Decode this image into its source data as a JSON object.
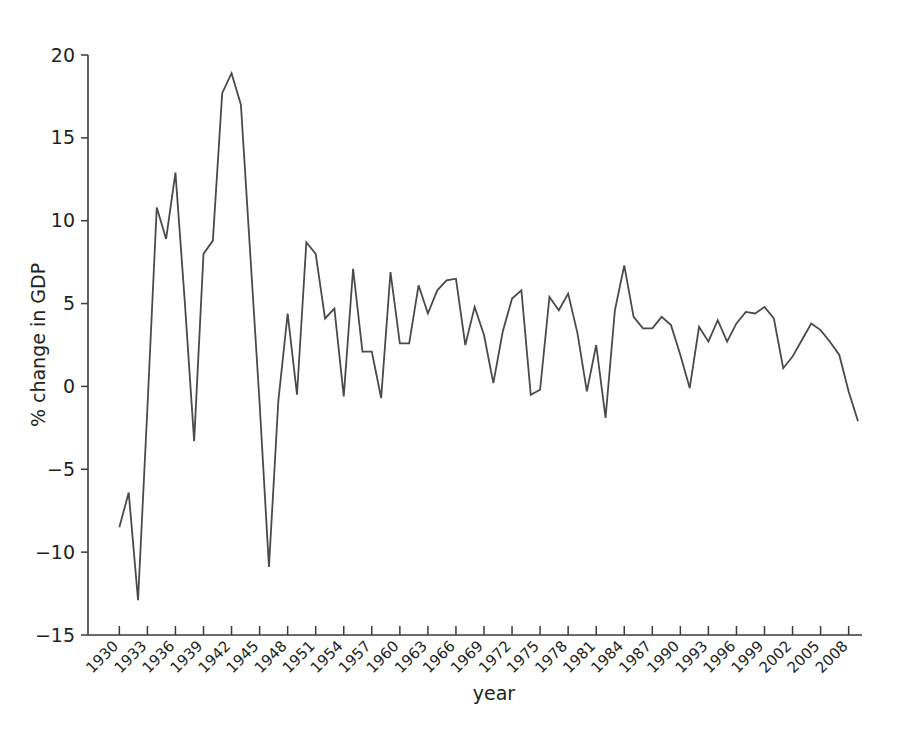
{
  "chart_data": {
    "type": "line",
    "title": "",
    "xlabel": "year",
    "ylabel": "% change in GDP",
    "xlim": [
      1929,
      2009
    ],
    "ylim": [
      -15,
      20
    ],
    "yticks": [
      20,
      15,
      10,
      5,
      0,
      -5,
      -10,
      -15
    ],
    "ytick_labels": [
      "20",
      "15",
      "10",
      "5",
      "0",
      "−5",
      "−10",
      "−15"
    ],
    "xticks": [
      1930,
      1933,
      1936,
      1939,
      1942,
      1945,
      1948,
      1951,
      1954,
      1957,
      1960,
      1963,
      1966,
      1969,
      1972,
      1975,
      1978,
      1981,
      1984,
      1987,
      1990,
      1993,
      1996,
      1999,
      2002,
      2005,
      2008
    ],
    "xtick_labels": [
      "1930",
      "1933",
      "1936",
      "1939",
      "1942",
      "1945",
      "1948",
      "1951",
      "1954",
      "1957",
      "1960",
      "1963",
      "1966",
      "1969",
      "1972",
      "1975",
      "1978",
      "1981",
      "1984",
      "1987",
      "1990",
      "1993",
      "1996",
      "1999",
      "2002",
      "2005",
      "2008"
    ],
    "xtick_minor_step": 1,
    "grid": false,
    "legend": false,
    "line_color": "#4a4a4a",
    "x": [
      1930,
      1931,
      1932,
      1933,
      1934,
      1935,
      1936,
      1937,
      1938,
      1939,
      1940,
      1941,
      1942,
      1943,
      1944,
      1945,
      1946,
      1947,
      1948,
      1949,
      1950,
      1951,
      1952,
      1953,
      1954,
      1955,
      1956,
      1957,
      1958,
      1959,
      1960,
      1961,
      1962,
      1963,
      1964,
      1965,
      1966,
      1967,
      1968,
      1969,
      1970,
      1971,
      1972,
      1973,
      1974,
      1975,
      1976,
      1977,
      1978,
      1979,
      1980,
      1981,
      1982,
      1983,
      1984,
      1985,
      1986,
      1987,
      1988,
      1989,
      1990,
      1991,
      1992,
      1993,
      1994,
      1995,
      1996,
      1997,
      1998,
      1999,
      2000,
      2001,
      2002,
      2003,
      2004,
      2005,
      2006,
      2007,
      2008,
      2009
    ],
    "y": [
      -8.5,
      -6.4,
      -12.9,
      -1.3,
      10.8,
      8.9,
      12.9,
      5.1,
      -3.3,
      8.0,
      8.8,
      17.7,
      18.9,
      17.0,
      8.0,
      -1.0,
      -10.9,
      -0.9,
      4.4,
      -0.5,
      8.7,
      8.0,
      4.1,
      4.7,
      -0.6,
      7.1,
      2.1,
      2.1,
      -0.7,
      6.9,
      2.6,
      2.6,
      6.1,
      4.4,
      5.8,
      6.4,
      6.5,
      2.5,
      4.8,
      3.1,
      0.2,
      3.3,
      5.3,
      5.8,
      -0.5,
      -0.2,
      5.4,
      4.6,
      5.6,
      3.2,
      -0.3,
      2.5,
      -1.9,
      4.6,
      7.3,
      4.2,
      3.5,
      3.5,
      4.2,
      3.7,
      1.9,
      -0.1,
      3.6,
      2.7,
      4.0,
      2.7,
      3.8,
      4.5,
      4.4,
      4.8,
      4.1,
      1.1,
      1.8,
      2.8,
      3.8,
      3.4,
      2.7,
      1.9,
      -0.3,
      -2.1
    ]
  }
}
